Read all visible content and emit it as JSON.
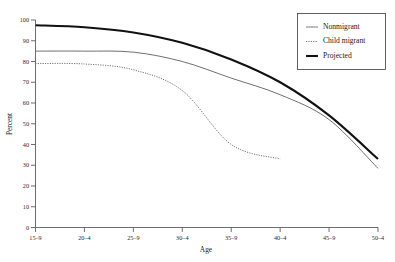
{
  "chart_data": {
    "type": "line",
    "title": "",
    "xlabel": "Age",
    "ylabel": "Percent",
    "categories": [
      "15–9",
      "20–4",
      "25–9",
      "30–4",
      "35–9",
      "40–4",
      "45–9",
      "50–4"
    ],
    "ylim": [
      0,
      100
    ],
    "yticks": [
      0,
      10,
      20,
      30,
      40,
      50,
      60,
      70,
      80,
      90,
      100
    ],
    "grid": false,
    "legend_position": "top-right",
    "series": [
      {
        "name": "Nonmigrant",
        "style": "thin-solid",
        "color": "#555555",
        "values": [
          85,
          85,
          84.5,
          80,
          72,
          64,
          52,
          28.5
        ]
      },
      {
        "name": "Child migrant",
        "style": "dotted",
        "color": "#6b6b6b",
        "values": [
          79,
          78.8,
          76,
          66,
          40,
          33,
          null,
          null
        ]
      },
      {
        "name": "Projected",
        "style": "thick-solid",
        "color": "#111111",
        "values": [
          97.5,
          96.5,
          94,
          89,
          81,
          70,
          54,
          33
        ]
      }
    ]
  },
  "axes": {
    "y_title": "Percent",
    "x_title": "Age"
  },
  "legend": {
    "items": [
      {
        "label": "Nonmigrant"
      },
      {
        "label": "Child migrant"
      },
      {
        "label": "Projected"
      }
    ]
  }
}
